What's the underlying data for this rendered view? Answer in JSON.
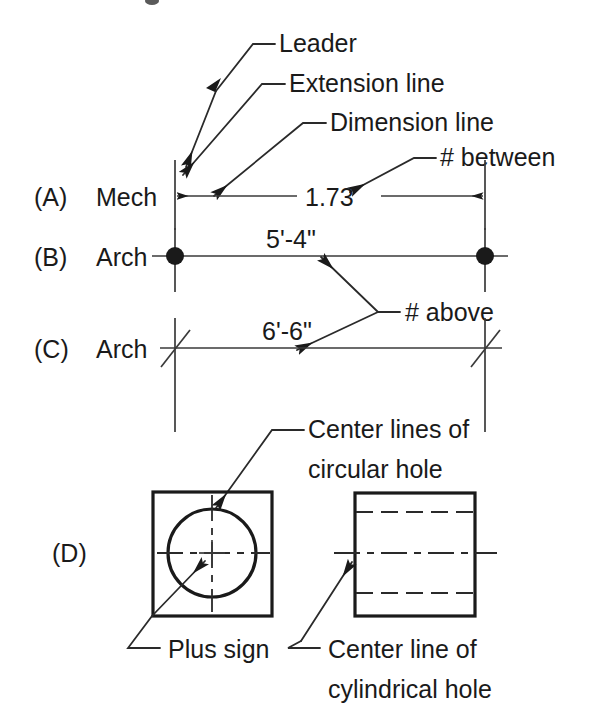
{
  "figure": {
    "title_visible": false,
    "background_color": "#ffffff",
    "ink_color": "#1a1a1a"
  },
  "callouts": {
    "leader": "Leader",
    "extension_line": "Extension line",
    "dimension_line": "Dimension line",
    "number_between": "# between",
    "number_above": "# above",
    "center_lines_circular_1": "Center lines of",
    "center_lines_circular_2": "circular hole",
    "plus_sign": "Plus sign",
    "center_line_cylindrical_1": "Center line of",
    "center_line_cylindrical_2": "cylindrical hole"
  },
  "rows": [
    {
      "key": "A",
      "tag": "(A)",
      "style_label": "Mech",
      "dimension_value": "1.73",
      "terminator": "arrowheads",
      "number_placement": "between"
    },
    {
      "key": "B",
      "tag": "(B)",
      "style_label": "Arch",
      "dimension_value": "5'-4\"",
      "terminator": "dots",
      "number_placement": "above"
    },
    {
      "key": "C",
      "tag": "(C)",
      "style_label": "Arch",
      "dimension_value": "6'-6\"",
      "terminator": "slashes",
      "number_placement": "above"
    },
    {
      "key": "D",
      "tag": "(D)",
      "style_label": "",
      "dimension_value": "",
      "terminator": "center-lines",
      "number_placement": ""
    }
  ],
  "shapes": {
    "square_with_circle": {
      "name": "square with circular hole",
      "center_mark": "plus sign",
      "center_line_style": "dash-dot"
    },
    "rectangle_side_view": {
      "name": "rectangle with cylindrical hole side view",
      "hidden_line_style": "dashed",
      "center_line_style": "dash-dot"
    }
  },
  "icon_names": {
    "arrowhead": "arrowhead-icon",
    "dot_terminator": "dot-terminator-icon",
    "slash_terminator": "slash-terminator-icon",
    "plus_center_mark": "plus-center-mark-icon"
  }
}
